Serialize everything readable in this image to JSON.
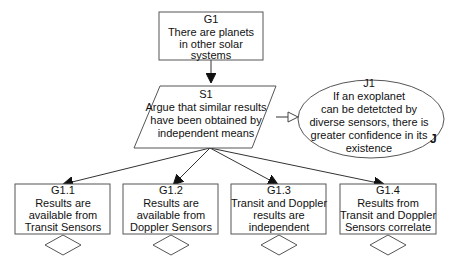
{
  "diagram": {
    "type": "GSN goal structure",
    "colors": {
      "stroke": "#555555",
      "fill": "#ffffff",
      "text": "#111111"
    },
    "nodes": {
      "g1": {
        "id": "G1",
        "kind": "goal",
        "lines": [
          "There are planets",
          "in other solar",
          "systems"
        ]
      },
      "s1": {
        "id": "S1",
        "kind": "strategy",
        "lines": [
          "Argue that similar results",
          "have been obtained by",
          "independent means"
        ]
      },
      "j1": {
        "id": "J1",
        "kind": "justification",
        "lines": [
          "If an exoplanet",
          "can be detetcted by",
          "diverse sensors, there is",
          "greater confidence in its",
          "existence"
        ],
        "marker": "J"
      },
      "g11": {
        "id": "G1.1",
        "kind": "goal",
        "lines": [
          "Results are",
          "available from",
          "Transit Sensors"
        ],
        "undeveloped": true
      },
      "g12": {
        "id": "G1.2",
        "kind": "goal",
        "lines": [
          "Results are",
          "available from",
          "Doppler Sensors"
        ],
        "undeveloped": true
      },
      "g13": {
        "id": "G1.3",
        "kind": "goal",
        "lines": [
          "Transit and Doppler",
          "results are",
          "independent"
        ],
        "undeveloped": true
      },
      "g14": {
        "id": "G1.4",
        "kind": "goal",
        "lines": [
          "Results from",
          "Transit and Doppler",
          "Sensors correlate"
        ],
        "undeveloped": true
      }
    },
    "edges": [
      {
        "from": "G1",
        "to": "S1",
        "type": "supported-by"
      },
      {
        "from": "S1",
        "to": "J1",
        "type": "in-context-of"
      },
      {
        "from": "S1",
        "to": "G1.1",
        "type": "supported-by"
      },
      {
        "from": "S1",
        "to": "G1.2",
        "type": "supported-by"
      },
      {
        "from": "S1",
        "to": "G1.3",
        "type": "supported-by"
      },
      {
        "from": "S1",
        "to": "G1.4",
        "type": "supported-by"
      }
    ]
  }
}
